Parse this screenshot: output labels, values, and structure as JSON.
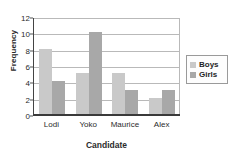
{
  "chart_data": {
    "type": "bar",
    "title": "",
    "xlabel": "Candidate",
    "ylabel": "Frequency",
    "categories": [
      "Lodi",
      "Yoko",
      "Maurice",
      "Alex"
    ],
    "series": [
      {
        "name": "Boys",
        "values": [
          8,
          5,
          5,
          1.9
        ],
        "color": "#c9c9c9"
      },
      {
        "name": "Girls",
        "values": [
          4,
          10,
          2.9,
          2.9
        ],
        "color": "#a8a8a8"
      }
    ],
    "ylim": [
      0,
      12
    ],
    "yticks": [
      0,
      2,
      4,
      6,
      8,
      10,
      12
    ],
    "ytick_labels": [
      "0",
      "2",
      "4",
      "6",
      "8",
      "10",
      "12"
    ],
    "grid": true,
    "legend_position": "right",
    "legend_entries": [
      "Boys",
      "Girls"
    ]
  },
  "axes": {
    "ylabel": "Frequency",
    "xlabel": "Candidate"
  },
  "colors": {
    "boys": "#c9c9c9",
    "girls": "#a8a8a8",
    "gridline": "#b9b9b9",
    "axis": "#3a3a3a",
    "text": "#2b2b2b",
    "background": "#ffffff"
  }
}
